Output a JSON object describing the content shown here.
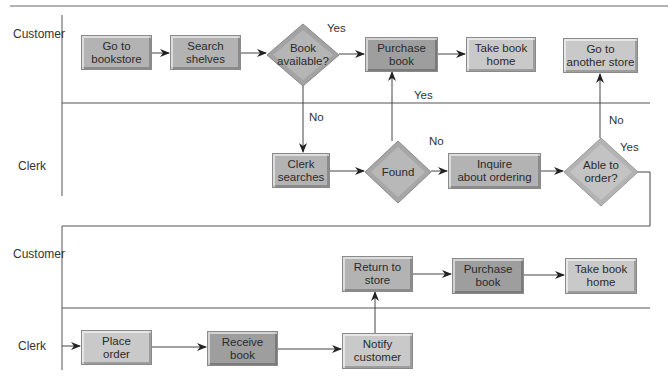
{
  "diagram": {
    "type": "swimlane-flowchart",
    "colors": {
      "box_light": "#c9c9c9",
      "box_mid": "#b3b3b3",
      "box_dark": "#9e9e9e",
      "line": "#555555",
      "diamond": "#a9a9a9"
    },
    "lanes": [
      {
        "id": "customer1",
        "label": "Customer"
      },
      {
        "id": "clerk1",
        "label": "Clerk"
      },
      {
        "id": "customer2",
        "label": "Customer"
      },
      {
        "id": "clerk2",
        "label": "Clerk"
      }
    ],
    "nodes": {
      "go_to_bookstore": {
        "line1": "Go to",
        "line2": "bookstore",
        "shape": "process",
        "lane": "customer1"
      },
      "search_shelves": {
        "line1": "Search",
        "line2": "shelves",
        "shape": "process",
        "lane": "customer1"
      },
      "book_available": {
        "line1": "Book",
        "line2": "available?",
        "shape": "decision",
        "lane": "customer1"
      },
      "purchase_book_1": {
        "line1": "Purchase",
        "line2": "book",
        "shape": "process",
        "lane": "customer1"
      },
      "take_book_home_1": {
        "line1": "Take book",
        "line2": "home",
        "shape": "process",
        "lane": "customer1"
      },
      "go_to_another_store": {
        "line1": "Go to",
        "line2": "another store",
        "shape": "process",
        "lane": "customer1"
      },
      "clerk_searches": {
        "line1": "Clerk",
        "line2": "searches",
        "shape": "process",
        "lane": "clerk1"
      },
      "found": {
        "line1": "Found",
        "shape": "decision",
        "lane": "clerk1"
      },
      "inquire_about_ordering": {
        "line1": "Inquire",
        "line2": "about ordering",
        "shape": "process",
        "lane": "clerk1"
      },
      "able_to_order": {
        "line1": "Able to",
        "line2": "order?",
        "shape": "decision",
        "lane": "clerk1"
      },
      "return_to_store": {
        "line1": "Return to",
        "line2": "store",
        "shape": "process",
        "lane": "customer2"
      },
      "purchase_book_2": {
        "line1": "Purchase",
        "line2": "book",
        "shape": "process",
        "lane": "customer2"
      },
      "take_book_home_2": {
        "line1": "Take book",
        "line2": "home",
        "shape": "process",
        "lane": "customer2"
      },
      "place_order": {
        "line1": "Place",
        "line2": "order",
        "shape": "process",
        "lane": "clerk2"
      },
      "receive_book": {
        "line1": "Receive",
        "line2": "book",
        "shape": "process",
        "lane": "clerk2"
      },
      "notify_customer": {
        "line1": "Notify",
        "line2": "customer",
        "shape": "process",
        "lane": "clerk2"
      }
    },
    "edge_labels": {
      "book_available_yes": "Yes",
      "book_available_no": "No",
      "found_yes": "Yes",
      "found_no": "No",
      "able_to_order_no": "No",
      "able_to_order_yes": "Yes"
    },
    "edges": [
      {
        "from": "go_to_bookstore",
        "to": "search_shelves"
      },
      {
        "from": "search_shelves",
        "to": "book_available"
      },
      {
        "from": "book_available",
        "to": "purchase_book_1",
        "label": "Yes"
      },
      {
        "from": "book_available",
        "to": "clerk_searches",
        "label": "No"
      },
      {
        "from": "purchase_book_1",
        "to": "take_book_home_1"
      },
      {
        "from": "clerk_searches",
        "to": "found"
      },
      {
        "from": "found",
        "to": "purchase_book_1",
        "label": "Yes"
      },
      {
        "from": "found",
        "to": "inquire_about_ordering",
        "label": "No"
      },
      {
        "from": "inquire_about_ordering",
        "to": "able_to_order"
      },
      {
        "from": "able_to_order",
        "to": "go_to_another_store",
        "label": "No"
      },
      {
        "from": "able_to_order",
        "to": "place_order",
        "label": "Yes"
      },
      {
        "from": "place_order",
        "to": "receive_book"
      },
      {
        "from": "receive_book",
        "to": "notify_customer"
      },
      {
        "from": "notify_customer",
        "to": "return_to_store"
      },
      {
        "from": "return_to_store",
        "to": "purchase_book_2"
      },
      {
        "from": "purchase_book_2",
        "to": "take_book_home_2"
      }
    ]
  }
}
